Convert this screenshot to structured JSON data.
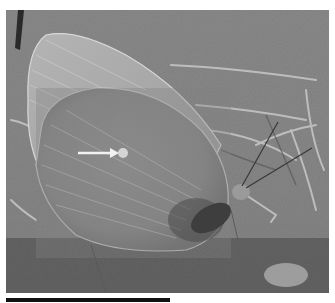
{
  "figure": {
    "type": "photograph",
    "colormode": "grayscale",
    "annotation": {
      "kind": "arrow",
      "direction": "right",
      "points_to": "pale discal spot on hindwing underside"
    },
    "scale_bar": {
      "visible": true,
      "label": ""
    }
  },
  "colors": {
    "background": "#ffffff",
    "photo_mid": "#8a8a8a",
    "wing": "#9a9a9a",
    "arrow": "#f2f2f2",
    "scale_bar": "#111111"
  }
}
